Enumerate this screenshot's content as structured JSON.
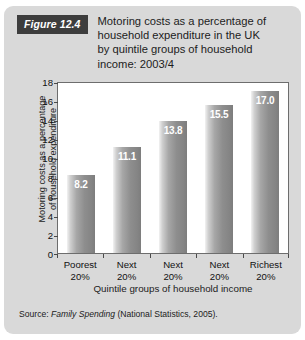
{
  "figure": {
    "badge_label": "Figure 12.4",
    "title_lines": [
      "Motoring costs as a percentage of",
      "household expenditure in the UK",
      "by quintile groups of household",
      "income: 2003/4"
    ],
    "source_prefix": "Source: ",
    "source_italic": "Family Spending",
    "source_suffix": " (National Statistics, 2005).",
    "card_background": "#d9d9d9",
    "badge_background": "#3d3d3d",
    "badge_text_color": "#ffffff"
  },
  "chart_data": {
    "type": "bar",
    "title": "Motoring costs as a percentage of household expenditure in the UK by quintile groups of household income: 2003/4",
    "categories": [
      "Poorest 20%",
      "Next 20%",
      "Next 20%",
      "Next 20%",
      "Richest 20%"
    ],
    "category_lines": [
      [
        "Poorest",
        "20%"
      ],
      [
        "Next",
        "20%"
      ],
      [
        "Next",
        "20%"
      ],
      [
        "Next",
        "20%"
      ],
      [
        "Richest",
        "20%"
      ]
    ],
    "values": [
      8.2,
      11.1,
      13.8,
      15.5,
      17.0
    ],
    "value_labels": [
      "8.2",
      "11.1",
      "13.8",
      "15.5",
      "17.0"
    ],
    "xlabel": "Quintile groups of household income",
    "ylabel": "Motoring costs as a percentage of household expenditure",
    "ylabel_lines": [
      "Motoring costs as a percentage",
      "of household expenditure"
    ],
    "ylim": [
      0,
      18
    ],
    "ytick_step": 2,
    "yticks": [
      0,
      2,
      4,
      6,
      8,
      10,
      12,
      14,
      16,
      18
    ],
    "ytick_labels": [
      "0",
      "2",
      "4",
      "6",
      "8",
      "10",
      "12",
      "14",
      "16",
      "18"
    ],
    "grid": false,
    "legend": null,
    "plot_background": "#ffffff",
    "bar_color_light": "#f2f2f2",
    "bar_color_dark": "#7d7d7d",
    "value_label_color": "#ffffff"
  }
}
